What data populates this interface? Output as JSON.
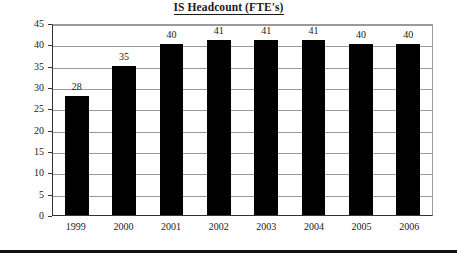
{
  "chart_data": {
    "type": "bar",
    "title": "IS Headcount (FTE's)",
    "xlabel": "",
    "ylabel": "",
    "categories": [
      "1999",
      "2000",
      "2001",
      "2002",
      "2003",
      "2004",
      "2005",
      "2006"
    ],
    "values": [
      28,
      35,
      40,
      41,
      41,
      41,
      40,
      40
    ],
    "data_labels": [
      "28",
      "35",
      "40",
      "41",
      "41",
      "41",
      "40",
      "40"
    ],
    "ylim": [
      0,
      45
    ],
    "ytick_step": 5,
    "yticks": [
      "45",
      "40",
      "35",
      "30",
      "25",
      "20",
      "15",
      "10",
      "5",
      "0"
    ],
    "grid": true,
    "legend": false,
    "legend_position": "none",
    "bar_color": "#000000",
    "gridline_color": "#9a9a9a",
    "axis_color": "#333333",
    "background_color": "#ffffff",
    "text_color": "#1a1a1a"
  },
  "page": {
    "bottom_rule_color": "#111111"
  }
}
